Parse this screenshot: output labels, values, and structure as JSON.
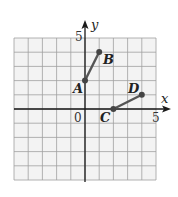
{
  "figure": {
    "x_axis_label": "x",
    "y_axis_label": "y",
    "origin_label": "0",
    "x_tick_label": "5",
    "y_tick_label": "5",
    "grid": {
      "xmin": -5,
      "xmax": 5,
      "ymin": -5,
      "ymax": 5,
      "step": 1
    },
    "colors": {
      "grid": "#9a9a9a",
      "grid_bg": "#f3f3f3",
      "axis": "#1a1a1a",
      "segment": "#555555",
      "point": "#444444"
    }
  },
  "chart_data": {
    "type": "scatter",
    "title": "",
    "xlabel": "x",
    "ylabel": "y",
    "xlim": [
      -5,
      5
    ],
    "ylim": [
      -5,
      5
    ],
    "grid": true,
    "points": [
      {
        "label": "A",
        "x": 0,
        "y": 2
      },
      {
        "label": "B",
        "x": 1,
        "y": 4
      },
      {
        "label": "C",
        "x": 2,
        "y": 0
      },
      {
        "label": "D",
        "x": 4,
        "y": 1
      }
    ],
    "segments": [
      {
        "from": "A",
        "to": "B"
      },
      {
        "from": "C",
        "to": "D"
      }
    ],
    "tick_labels": {
      "origin": "0",
      "x": "5",
      "y": "5"
    }
  }
}
